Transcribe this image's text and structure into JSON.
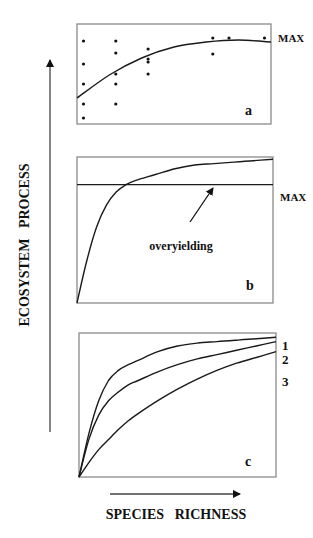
{
  "figure": {
    "y_axis_label": "ECOSYSTEM   PROCESS",
    "x_axis_label": "SPECIES   RICHNESS",
    "max_label": "MAX",
    "panels": [
      {
        "id": "a",
        "label": "a",
        "description": "Scatter of ecosystem process vs. species richness with a saturating fitted curve; monocultures/mixtures never exceed the best single species (MAX)."
      },
      {
        "id": "b",
        "label": "b",
        "annotation": "overyielding",
        "description": "Saturating curve rising above the MAX line (overyielding)."
      },
      {
        "id": "c",
        "label": "c",
        "curve_labels": [
          "1",
          "2",
          "3"
        ],
        "description": "Three saturating curves with decreasing slopes."
      }
    ]
  },
  "chart_data": [
    {
      "type": "scatter",
      "panel": "a",
      "title": "",
      "xlabel": "Species richness",
      "ylabel": "Ecosystem process",
      "xlim": [
        0,
        6
      ],
      "ylim": [
        0,
        10
      ],
      "grid": false,
      "points": [
        {
          "x": 0.2,
          "y": 8.3
        },
        {
          "x": 0.2,
          "y": 6.0
        },
        {
          "x": 0.2,
          "y": 4.0
        },
        {
          "x": 0.2,
          "y": 2.0
        },
        {
          "x": 0.2,
          "y": 0.6
        },
        {
          "x": 1.2,
          "y": 8.3
        },
        {
          "x": 1.2,
          "y": 7.1
        },
        {
          "x": 1.2,
          "y": 5.0
        },
        {
          "x": 1.2,
          "y": 4.0
        },
        {
          "x": 1.2,
          "y": 2.0
        },
        {
          "x": 2.2,
          "y": 7.5
        },
        {
          "x": 2.2,
          "y": 6.5
        },
        {
          "x": 2.2,
          "y": 6.2
        },
        {
          "x": 2.2,
          "y": 5.0
        },
        {
          "x": 4.2,
          "y": 8.6
        },
        {
          "x": 4.2,
          "y": 7.0
        },
        {
          "x": 4.7,
          "y": 8.6
        },
        {
          "x": 5.8,
          "y": 8.6
        }
      ],
      "fit_curve": {
        "x": [
          0,
          1,
          2,
          3,
          4,
          5,
          6
        ],
        "y": [
          2.6,
          4.9,
          6.6,
          7.7,
          8.2,
          8.4,
          8.2
        ]
      },
      "annotations": [
        {
          "text": "MAX",
          "at": "right",
          "y": 8.6
        }
      ]
    },
    {
      "type": "line",
      "panel": "b",
      "xlabel": "Species richness",
      "ylabel": "Ecosystem process",
      "xlim": [
        0,
        10
      ],
      "ylim": [
        0,
        10
      ],
      "grid": false,
      "series": [
        {
          "name": "process",
          "x": [
            0,
            0.5,
            1,
            1.5,
            2,
            2.5,
            3,
            4,
            5,
            6,
            7,
            8,
            9,
            10
          ],
          "y": [
            0,
            2.9,
            5.2,
            6.7,
            7.6,
            8.1,
            8.4,
            8.8,
            9.2,
            9.45,
            9.55,
            9.65,
            9.75,
            9.85
          ]
        },
        {
          "name": "MAX",
          "x": [
            0,
            10
          ],
          "y": [
            8.1,
            8.1
          ]
        }
      ],
      "annotations": [
        {
          "text": "overyielding",
          "points_to": "curve above MAX"
        }
      ]
    },
    {
      "type": "line",
      "panel": "c",
      "xlabel": "Species richness",
      "ylabel": "Ecosystem process",
      "xlim": [
        0,
        10
      ],
      "ylim": [
        0,
        10
      ],
      "grid": false,
      "series": [
        {
          "name": "1",
          "x": [
            0,
            0.5,
            1,
            1.5,
            2,
            2.5,
            3,
            4,
            5,
            6,
            7,
            8,
            9,
            10
          ],
          "y": [
            0,
            3.0,
            5.3,
            6.7,
            7.4,
            7.8,
            8.1,
            8.7,
            9.1,
            9.3,
            9.4,
            9.5,
            9.6,
            9.7
          ]
        },
        {
          "name": "2",
          "x": [
            0,
            0.5,
            1,
            1.5,
            2,
            2.5,
            3,
            4,
            5,
            6,
            7,
            8,
            9,
            10
          ],
          "y": [
            0,
            2.6,
            4.3,
            5.3,
            5.9,
            6.4,
            6.7,
            7.3,
            7.8,
            8.2,
            8.5,
            8.8,
            9.1,
            9.4
          ]
        },
        {
          "name": "3",
          "x": [
            0,
            0.5,
            1,
            1.5,
            2,
            2.5,
            3,
            4,
            5,
            6,
            7,
            8,
            9,
            10
          ],
          "y": [
            0,
            1.0,
            1.9,
            2.6,
            3.3,
            3.9,
            4.4,
            5.3,
            6.1,
            6.8,
            7.4,
            7.9,
            8.3,
            8.7
          ]
        }
      ]
    }
  ]
}
